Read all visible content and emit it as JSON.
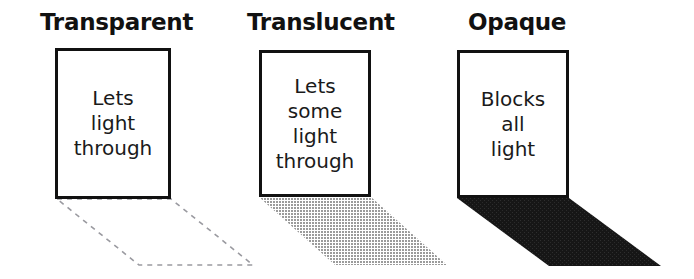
{
  "figure": {
    "background_color": "#ffffff",
    "ink_color": "#111111"
  },
  "panels": [
    {
      "id": "transparent",
      "title": "Transparent",
      "slab_text": "Lets\nlight\nthrough",
      "shadow": {
        "kind": "dashed-outline",
        "semantic_name": "shadow-outline-dashed",
        "fill": "none",
        "stroke": "#9a9aa0",
        "stroke_width": 1.6,
        "dash_pattern": "5 5",
        "description": "no shadow - only a faint dashed outline where a shadow would fall",
        "points": "57,199 171,199 253,265 139,265"
      }
    },
    {
      "id": "translucent",
      "title": "Translucent",
      "slab_text": "Lets\nsome\nlight\nthrough",
      "shadow": {
        "kind": "halftone-gray",
        "semantic_name": "shadow-light-gray",
        "fill": "#b4b4b4",
        "stroke": "none",
        "description": "faint light-gray halftone shadow",
        "points": "259,197 371,197 447,265 335,265"
      }
    },
    {
      "id": "opaque",
      "title": "Opaque",
      "slab_text": "Blocks\nall\nlight",
      "shadow": {
        "kind": "solid-black",
        "semantic_name": "shadow-solid-black",
        "fill": "#1a1a1a",
        "stroke": "none",
        "description": "dark solid shadow",
        "points": "457,198 569,198 661,266 549,266"
      }
    }
  ]
}
